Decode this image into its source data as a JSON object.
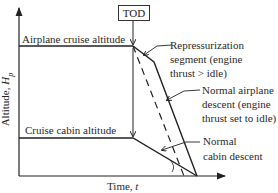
{
  "diagram": {
    "marker": "TOD",
    "y_axis_label": "Altitude, Hp",
    "y_axis_label_main": "Altitude, ",
    "y_axis_label_var": "H",
    "y_axis_label_sub": "p",
    "x_axis_label_main": "Time, ",
    "x_axis_label_var": "t",
    "levels": {
      "airplane": "Airplane cruise altitude",
      "cabin": "Cruise cabin altitude"
    },
    "annotations": {
      "repress_1": "Repressurization",
      "repress_2": "segment (engine",
      "repress_3": "thrust > idle)",
      "airplane_1": "Normal airplane",
      "airplane_2": "descent (engine",
      "airplane_3": "thrust set to idle)",
      "cabin_1": "Normal",
      "cabin_2": "cabin descent"
    },
    "colors": {
      "line": "#222222",
      "background": "#ffffff"
    }
  }
}
